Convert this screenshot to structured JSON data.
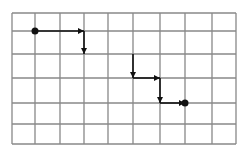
{
  "diagram": {
    "type": "grid-path",
    "grid": {
      "columns": 9,
      "rows": 6,
      "x_lines": [
        12,
        35,
        60,
        84,
        108,
        133,
        160,
        185,
        212,
        236
      ],
      "y_lines": [
        13,
        31,
        54,
        78,
        103,
        124,
        144
      ],
      "line_color": "#888888"
    },
    "path": {
      "color": "#111111",
      "start": {
        "col": 1,
        "row": 1
      },
      "end": {
        "col": 7,
        "row": 4
      },
      "segments": [
        {
          "from": [
            1,
            1
          ],
          "to": [
            3,
            1
          ],
          "direction": "right"
        },
        {
          "from": [
            3,
            1
          ],
          "to": [
            3,
            2
          ],
          "direction": "down"
        },
        {
          "from": [
            5,
            2
          ],
          "to": [
            5,
            3
          ],
          "direction": "down"
        },
        {
          "from": [
            5,
            3
          ],
          "to": [
            6,
            3
          ],
          "direction": "right"
        },
        {
          "from": [
            6,
            3
          ],
          "to": [
            6,
            4
          ],
          "direction": "down"
        },
        {
          "from": [
            6,
            4
          ],
          "to": [
            7,
            4
          ],
          "direction": "right"
        }
      ]
    }
  }
}
